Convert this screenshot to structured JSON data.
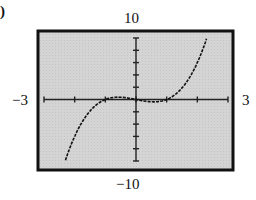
{
  "figure": {
    "part_label": ")",
    "ymax_label": "10",
    "ymin_label": "−10",
    "xmin_label": "−3",
    "xmax_label": "3"
  },
  "chart_data": {
    "type": "line",
    "title": "",
    "xlabel": "",
    "ylabel": "",
    "xlim": [
      -3,
      3
    ],
    "ylim": [
      -10,
      10
    ],
    "x_tick_step": 1,
    "y_tick_step": 2,
    "grid": false,
    "background": "#d6d6d6",
    "series": [
      {
        "name": "y = x^3 - x",
        "x": [
          -2.3,
          -2.0,
          -1.5,
          -1.0,
          -0.577,
          0.0,
          0.577,
          1.0,
          1.5,
          2.0,
          2.3
        ],
        "values": [
          -9.87,
          -6.0,
          -1.88,
          0.0,
          0.385,
          0.0,
          -0.385,
          0.0,
          1.88,
          6.0,
          9.87
        ]
      }
    ]
  }
}
